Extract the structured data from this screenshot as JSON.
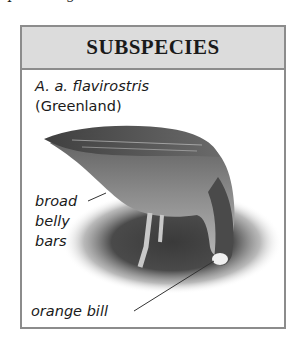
{
  "page": {
    "top_text_fragment": "species fig"
  },
  "panel": {
    "title": "SUBSPECIES",
    "scientific_name": "A. a. flavirostris",
    "region": "(Greenland)",
    "illustration": "white-fronted-goose-feeding",
    "annotations": [
      {
        "text_lines": [
          "broad",
          "belly",
          "bars"
        ]
      },
      {
        "text_lines": [
          "orange bill"
        ]
      }
    ]
  },
  "colors": {
    "border": "#8c8c8c",
    "header_bg": "#dcdcdc",
    "text": "#1a1a1a"
  }
}
